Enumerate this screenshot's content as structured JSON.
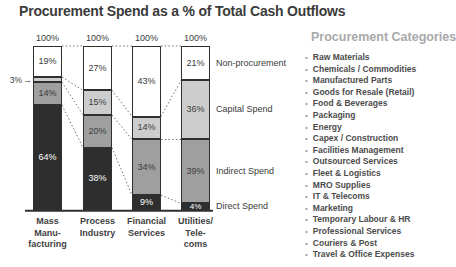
{
  "title": "Procurement Spend as a % of Total Cash Outflows",
  "chart_data": {
    "type": "bar",
    "subtype": "stacked-100-percent",
    "title": "Procurement Spend as a % of Total Cash Outflows",
    "total_label": "100%",
    "ylim": [
      0,
      100
    ],
    "grid": false,
    "legend_position": "right-of-last-bar",
    "categories": [
      {
        "label_lines": [
          "Mass",
          "Manu-",
          "facturing"
        ]
      },
      {
        "label_lines": [
          "Process",
          "Industry"
        ]
      },
      {
        "label_lines": [
          "Financial",
          "Services"
        ]
      },
      {
        "label_lines": [
          "Utilities/",
          "Tele-",
          "coms"
        ]
      }
    ],
    "series": [
      {
        "name": "Non-procurement",
        "color": "#ffffff",
        "text_color": "#3b3b3b",
        "values": [
          19,
          27,
          43,
          21
        ]
      },
      {
        "name": "Capital Spend",
        "color": "#cdcdcd",
        "text_color": "#3b3b3b",
        "values": [
          3,
          15,
          14,
          36
        ]
      },
      {
        "name": "Indirect Spend",
        "color": "#9f9f9f",
        "text_color": "#3b3b3b",
        "values": [
          14,
          20,
          34,
          39
        ]
      },
      {
        "name": "Direct Spend",
        "color": "#2e2e2e",
        "text_color": "#ffffff",
        "values": [
          64,
          38,
          9,
          4
        ]
      }
    ],
    "annotation": {
      "label": "3%",
      "arrow": "→",
      "bar_index": 0,
      "series_index": 1
    }
  },
  "side_panel": {
    "heading": "Procurement Categories",
    "items": [
      "Raw Materials",
      "Chemicals / Commodities",
      "Manufactured Parts",
      "Goods for Resale (Retail)",
      "Food & Beverages",
      "Packaging",
      "Energy",
      "Capex / Construction",
      "Facilities Management",
      "Outsourced Services",
      "Fleet & Logistics",
      "MRO Supplies",
      "IT & Telecoms",
      "Marketing",
      "Temporary Labour & HR",
      "Professional Services",
      "Couriers & Post",
      "Travel & Office Expenses"
    ]
  },
  "colors": {
    "axis": "#2f2f2f",
    "connector": "#5f5f5f",
    "title_text": "#3b3b3b",
    "heading_text": "#a9a9a9",
    "list_text": "#4c4c4c",
    "bullet": "#9e9e9e"
  }
}
